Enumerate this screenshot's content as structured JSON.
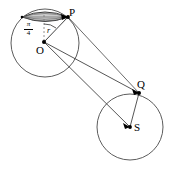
{
  "figure": {
    "type": "geometry-diagram",
    "width": 170,
    "height": 169,
    "background_color": "#ffffff",
    "stroke_color": "#3a3a3a",
    "dark_stroke_color": "#000000",
    "cap_fill_color": "#c9c9c9"
  },
  "labels": {
    "point_P": "P",
    "point_O": "O",
    "point_Q": "Q",
    "point_S": "S",
    "radius_r": "r",
    "angle_numerator": "π",
    "angle_denominator": "4"
  },
  "geometry": {
    "circle_left": {
      "cx": 45,
      "cy": 43,
      "r": 34
    },
    "circle_right": {
      "cx": 130,
      "cy": 127,
      "r": 33
    },
    "points": {
      "P": {
        "x": 68,
        "y": 17
      },
      "O": {
        "x": 44,
        "y": 42
      },
      "Q": {
        "x": 139,
        "y": 93
      },
      "S": {
        "x": 130,
        "y": 127
      }
    },
    "cap": {
      "left_edge_x": 22,
      "right_edge_x": 68,
      "top_y": 11,
      "chord_y": 17,
      "bottom_y": 21
    },
    "angle_label_value": "π/4",
    "segments": [
      {
        "from": "O",
        "to": "P",
        "label": "r"
      },
      {
        "from": "O",
        "to": "Q",
        "label": ""
      },
      {
        "from": "O",
        "to": "S",
        "label": ""
      },
      {
        "from": "P",
        "to": "Q",
        "label": ""
      },
      {
        "from": "Q",
        "to": "S",
        "label": ""
      }
    ],
    "dashed_axis": {
      "from_x": 44,
      "from_y": 42,
      "to_x": 44,
      "to_y": 13
    }
  }
}
